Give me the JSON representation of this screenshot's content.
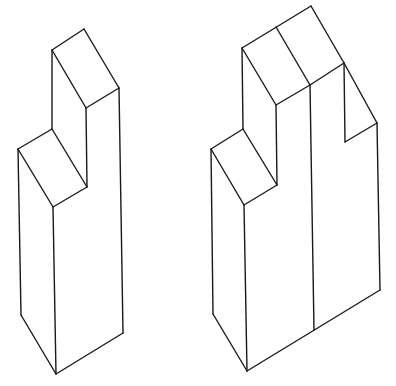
{
  "figure": {
    "background": "#ffffff",
    "stroke_color": "#1a1a1a",
    "shapes": [
      {
        "name": "left-stepped-block",
        "description": "single isometric stepped column block",
        "edges": [
          [
            52,
            50,
            84,
            29
          ],
          [
            84,
            29,
            119,
            88
          ],
          [
            119,
            88,
            86,
            108
          ],
          [
            86,
            108,
            52,
            50
          ],
          [
            52,
            50,
            52,
            129
          ],
          [
            52,
            129,
            18,
            149
          ],
          [
            18,
            149,
            53,
            207
          ],
          [
            53,
            207,
            87,
            187
          ],
          [
            87,
            187,
            52,
            129
          ],
          [
            86,
            108,
            87,
            187
          ],
          [
            119,
            88,
            123,
            333
          ],
          [
            18,
            149,
            21,
            315
          ],
          [
            53,
            207,
            56,
            374
          ],
          [
            21,
            315,
            56,
            374
          ],
          [
            56,
            374,
            123,
            333
          ]
        ]
      },
      {
        "name": "right-stepped-block",
        "description": "double-width isometric stepped column block with vertical divider and notch",
        "edges": [
          [
            242,
            48,
            311,
            6
          ],
          [
            311,
            6,
            344,
            63
          ],
          [
            242,
            48,
            276,
            105
          ],
          [
            276,
            105,
            310,
            85
          ],
          [
            310,
            85,
            344,
            63
          ],
          [
            276,
            27,
            310,
            85
          ],
          [
            242,
            48,
            243,
            129
          ],
          [
            243,
            129,
            211,
            149
          ],
          [
            211,
            149,
            244,
            205
          ],
          [
            244,
            205,
            277,
            185
          ],
          [
            277,
            185,
            243,
            129
          ],
          [
            276,
            105,
            277,
            185
          ],
          [
            310,
            85,
            314,
            330
          ],
          [
            344,
            63,
            345,
            142
          ],
          [
            345,
            142,
            377,
            123
          ],
          [
            344,
            63,
            377,
            123
          ],
          [
            377,
            123,
            380,
            290
          ],
          [
            211,
            149,
            213,
            314
          ],
          [
            244,
            205,
            247,
            371
          ],
          [
            213,
            314,
            247,
            371
          ],
          [
            247,
            371,
            380,
            290
          ]
        ]
      }
    ]
  }
}
